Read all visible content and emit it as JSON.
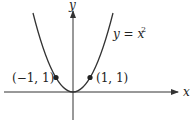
{
  "figure": {
    "function_label_lhs": "y = x",
    "function_label_exp": "2",
    "axis_x_label": "x",
    "axis_y_label": "y",
    "points": [
      {
        "label": "(−1, 1)",
        "x": -1,
        "y": 1
      },
      {
        "label": "(1, 1)",
        "x": 1,
        "y": 1
      }
    ],
    "colors": {
      "curve": "#333333",
      "axis": "#333333",
      "point": "#222222"
    }
  }
}
